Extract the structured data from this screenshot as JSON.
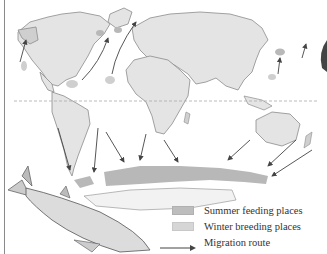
{
  "map": {
    "subject": "Humpback whale migration",
    "equator": "dashed line"
  },
  "legend": {
    "items": [
      {
        "key": "summer",
        "label": "Summer feeding places",
        "swatch_color": "#bdbdbd"
      },
      {
        "key": "winter",
        "label": "Winter breeding places",
        "swatch_color": "#d6d6d6"
      },
      {
        "key": "route",
        "label": "Migration route",
        "symbol": "arrow"
      }
    ]
  },
  "colors": {
    "land": "#e4e4e4",
    "coast": "#8c8c8c",
    "feeding": "#b8b8b8",
    "breeding": "#cfcfcf",
    "arrow": "#444444",
    "equator": "#aaaaaa"
  }
}
